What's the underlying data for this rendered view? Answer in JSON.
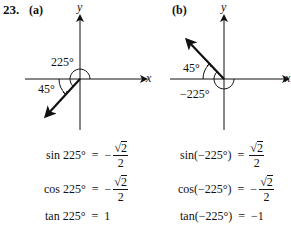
{
  "problem_number": "23.",
  "panels": [
    {
      "label": "(a)",
      "x_axis": "x",
      "y_axis": "y",
      "big_angle": "225°",
      "small_angle": "45°"
    },
    {
      "label": "(b)",
      "x_axis": "x",
      "y_axis": "y",
      "big_angle": "−225°",
      "small_angle": "45°"
    }
  ],
  "equations_a": [
    {
      "lhs": "sin 225°",
      "eq": "=",
      "sign": "−",
      "num": "2",
      "den": "2",
      "type": "frac"
    },
    {
      "lhs": "cos 225°",
      "eq": "=",
      "sign": "−",
      "num": "2",
      "den": "2",
      "type": "frac"
    },
    {
      "lhs": "tan 225°",
      "eq": "=",
      "value": "1",
      "type": "plain"
    }
  ],
  "equations_b": [
    {
      "lhs": "sin(−225°)",
      "eq": "=",
      "sign": "",
      "num": "2",
      "den": "2",
      "type": "frac"
    },
    {
      "lhs": "cos(−225°)",
      "eq": "=",
      "sign": "−",
      "num": "2",
      "den": "2",
      "type": "frac"
    },
    {
      "lhs": "tan(−225°)",
      "eq": "=",
      "value": "−1",
      "type": "plain"
    }
  ],
  "sqrt_symbol": "√"
}
